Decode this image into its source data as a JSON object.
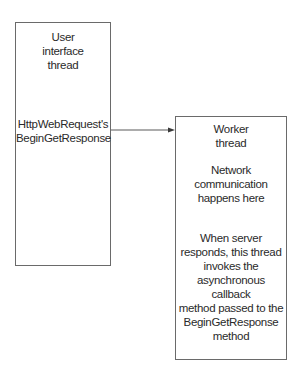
{
  "diagram": {
    "nodes": [
      {
        "id": "ui-thread",
        "title": "User\ninterface\nthread",
        "body": "HttpWebRequest's\nBeginGetResponse"
      },
      {
        "id": "worker-thread",
        "title": "Worker\nthread",
        "note1": "Network\ncommunication\nhappens here",
        "note2": "When server\nresponds, this thread\ninvokes the\nasynchronous callback\nmethod passed to the\nBeginGetResponse\nmethod"
      }
    ],
    "edges": [
      {
        "from": "ui-thread",
        "to": "worker-thread",
        "label": ""
      }
    ],
    "colors": {
      "stroke": "#6a6a6a",
      "text": "#2a2a2a",
      "background": "#ffffff"
    }
  }
}
